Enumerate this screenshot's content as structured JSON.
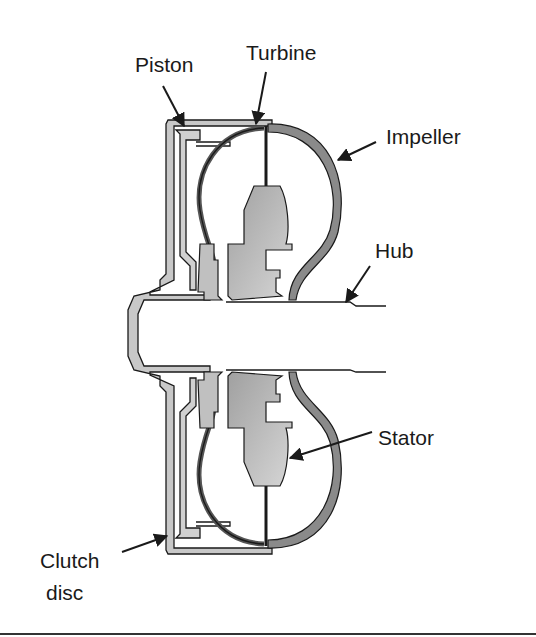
{
  "diagram": {
    "colors": {
      "line": "#1a1a1a",
      "impeller_fill": "#8a8a8a",
      "stator_fill": "#b5b5b5",
      "shell_fill": "#c8c8c8",
      "background": "#ffffff"
    },
    "labels": {
      "piston": "Piston",
      "turbine": "Turbine",
      "impeller": "Impeller",
      "hub": "Hub",
      "stator": "Stator",
      "clutch_line1": "Clutch",
      "clutch_line2": "disc"
    }
  }
}
